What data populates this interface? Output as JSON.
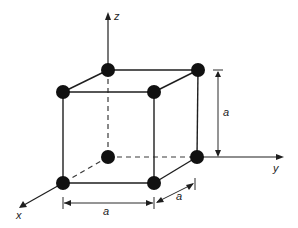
{
  "diagram": {
    "type": "simple cubic unit cell",
    "axes": {
      "x_label": "x",
      "y_label": "y",
      "z_label": "z"
    },
    "dimensions": {
      "vertical_label": "a",
      "horizontal_label": "a",
      "depth_label": "a"
    },
    "atom_count": 8,
    "colors": {
      "line": "#1e1e1e",
      "atom": "#111111",
      "background": "#ffffff"
    }
  }
}
